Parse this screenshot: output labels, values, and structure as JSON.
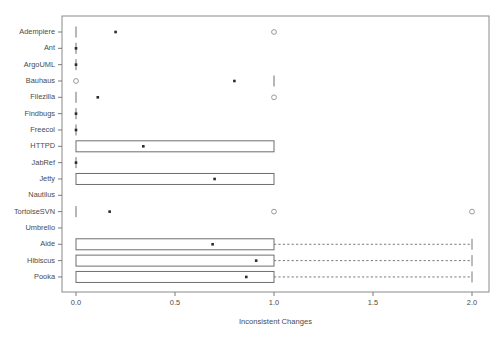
{
  "chart_data": {
    "type": "box",
    "title": "",
    "xlabel": "Inconsistent Changes",
    "ylabel": "",
    "xlim": [
      -0.07,
      2.1
    ],
    "xticks": [
      0.0,
      0.5,
      1.0,
      1.5,
      2.0
    ],
    "xticklabels": [
      "0.0",
      "0.5",
      "1.0",
      "1.5",
      "2.0"
    ],
    "grid": false,
    "legend": null,
    "orientation": "horizontal",
    "categories": [
      "Adempiere",
      "Ant",
      "ArgoUML",
      "Bauhaus",
      "Filezilla",
      "Findbugs",
      "Freecol",
      "HTTPD",
      "JabRef",
      "Jetty",
      "Nautilus",
      "TortoiseSVN",
      "Umbrello",
      "Aide",
      "Hibiscus",
      "Pooka"
    ],
    "boxes": [
      {
        "name": "Adempiere",
        "q1": 0.0,
        "median": 0.2,
        "q3": 0.0,
        "whisker_low": 0.0,
        "whisker_high": 0.0,
        "degenerate": true,
        "outliers": [
          1.0
        ]
      },
      {
        "name": "Ant",
        "q1": 0.0,
        "median": 0.0,
        "q3": 0.0,
        "whisker_low": 0.0,
        "whisker_high": 0.0,
        "degenerate": true,
        "outliers": []
      },
      {
        "name": "ArgoUML",
        "q1": 0.0,
        "median": 0.0,
        "q3": 0.0,
        "whisker_low": 0.0,
        "whisker_high": 0.0,
        "degenerate": true,
        "outliers": []
      },
      {
        "name": "Bauhaus",
        "q1": 1.0,
        "median": 0.8,
        "q3": 1.0,
        "whisker_low": 1.0,
        "whisker_high": 1.0,
        "degenerate": true,
        "outliers": [
          0.0
        ]
      },
      {
        "name": "Filezilla",
        "q1": 0.0,
        "median": 0.11,
        "q3": 0.0,
        "whisker_low": 0.0,
        "whisker_high": 0.0,
        "degenerate": true,
        "outliers": [
          1.0
        ]
      },
      {
        "name": "Findbugs",
        "q1": 0.0,
        "median": 0.0,
        "q3": 0.0,
        "whisker_low": 0.0,
        "whisker_high": 0.0,
        "degenerate": true,
        "outliers": []
      },
      {
        "name": "Freecol",
        "q1": 0.0,
        "median": 0.0,
        "q3": 0.0,
        "whisker_low": 0.0,
        "whisker_high": 0.0,
        "degenerate": true,
        "outliers": []
      },
      {
        "name": "HTTPD",
        "q1": 0.0,
        "median": 0.34,
        "q3": 1.0,
        "whisker_low": 0.0,
        "whisker_high": 1.0,
        "degenerate": false,
        "outliers": []
      },
      {
        "name": "JabRef",
        "q1": 0.0,
        "median": 0.0,
        "q3": 0.0,
        "whisker_low": 0.0,
        "whisker_high": 0.0,
        "degenerate": true,
        "outliers": []
      },
      {
        "name": "Jetty",
        "q1": 0.0,
        "median": 0.7,
        "q3": 1.0,
        "whisker_low": 0.0,
        "whisker_high": 1.0,
        "degenerate": false,
        "outliers": []
      },
      {
        "name": "Nautilus",
        "q1": null,
        "median": null,
        "q3": null,
        "whisker_low": null,
        "whisker_high": null,
        "degenerate": true,
        "outliers": []
      },
      {
        "name": "TortoiseSVN",
        "q1": 0.0,
        "median": 0.17,
        "q3": 0.0,
        "whisker_low": 0.0,
        "whisker_high": 0.0,
        "degenerate": true,
        "outliers": [
          1.0,
          2.0
        ]
      },
      {
        "name": "Umbrello",
        "q1": null,
        "median": null,
        "q3": null,
        "whisker_low": null,
        "whisker_high": null,
        "degenerate": true,
        "outliers": []
      },
      {
        "name": "Aide",
        "q1": 0.0,
        "median": 0.69,
        "q3": 1.0,
        "whisker_low": 0.0,
        "whisker_high": 2.0,
        "degenerate": false,
        "outliers": []
      },
      {
        "name": "Hibiscus",
        "q1": 0.0,
        "median": 0.91,
        "q3": 1.0,
        "whisker_low": 0.0,
        "whisker_high": 2.0,
        "degenerate": false,
        "outliers": []
      },
      {
        "name": "Pooka",
        "q1": 0.0,
        "median": 0.86,
        "q3": 1.0,
        "whisker_low": 0.0,
        "whisker_high": 2.0,
        "degenerate": false,
        "outliers": []
      }
    ]
  },
  "axis": {
    "x_title": "Inconsistent Changes",
    "x_tick_labels": [
      "0.0",
      "0.5",
      "1.0",
      "1.5",
      "2.0"
    ],
    "y_tick_labels": [
      "Adempiere",
      "Ant",
      "ArgoUML",
      "Bauhaus",
      "Filezilla",
      "Findbugs",
      "Freecol",
      "HTTPD",
      "JabRef",
      "Jetty",
      "Nautilus",
      "TortoiseSVN",
      "Umbrello",
      "Aide",
      "Hibiscus",
      "Pooka"
    ]
  },
  "colors": {
    "frame": "#8a8a8a",
    "box": "#6e6e6e",
    "median": "#2b2b2b",
    "outlier": "#9a9a9a",
    "text": "#4a4a4a",
    "background": "#ffffff"
  }
}
